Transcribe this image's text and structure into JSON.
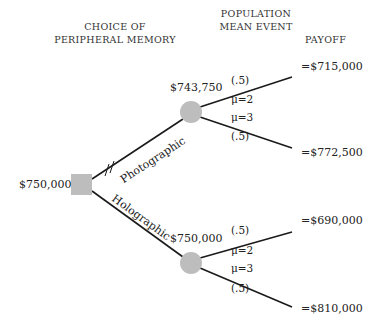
{
  "headers": {
    "choice": [
      "CHOICE OF",
      "PERIPHERAL MEMORY"
    ],
    "event": [
      "POPULATION",
      "MEAN EVENT"
    ],
    "payoff": "PAYOFF"
  },
  "decision_node": {
    "value": "$750,000"
  },
  "branches": {
    "photographic": {
      "label": "Photographic",
      "pruned_mark": "//",
      "node_value": "$743,750",
      "outcomes": [
        {
          "probability": "(.5)",
          "event": "μ=2",
          "payoff": "=$715,000"
        },
        {
          "probability": "(.5)",
          "event": "μ=3",
          "payoff": "=$772,500"
        }
      ]
    },
    "holographic": {
      "label": "Holographic",
      "node_value": "$750,000",
      "outcomes": [
        {
          "probability": "(.5)",
          "event": "μ=2",
          "payoff": "=$690,000"
        },
        {
          "probability": "(.5)",
          "event": "μ=3",
          "payoff": "=$810,000"
        }
      ]
    }
  },
  "colors": {
    "node_fill": "#bdbdbd",
    "line": "#1a1a1a"
  }
}
